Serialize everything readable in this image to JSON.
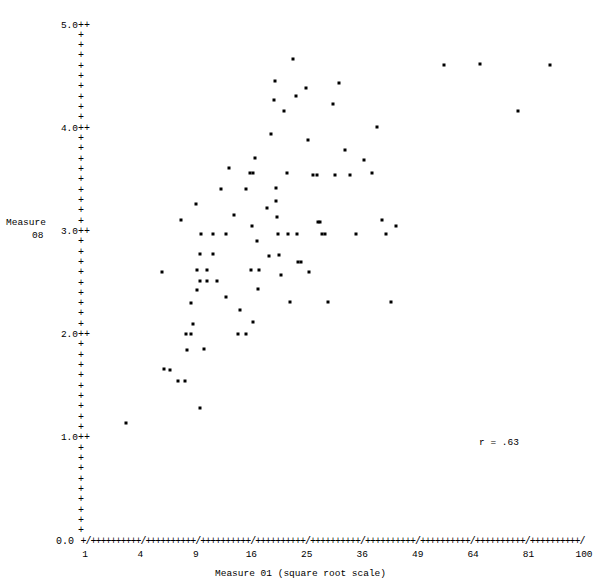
{
  "chart_data": {
    "type": "scatter",
    "title": "",
    "xlabel": "Measure 01 (square root scale)",
    "ylabel": "Measure 08",
    "ylabel_line1": "Measure",
    "ylabel_line2": "08",
    "x_scale": "sqrt",
    "x_tick_labels": [
      "1",
      "4",
      "9",
      "16",
      "25",
      "36",
      "49",
      "64",
      "81",
      "100"
    ],
    "x_tick_values": [
      1,
      4,
      9,
      16,
      25,
      36,
      49,
      64,
      81,
      100
    ],
    "y_tick_labels": [
      "5.0",
      "4.0",
      "3.0",
      "2.0",
      "1.0",
      "0.0"
    ],
    "y_tick_values": [
      5.0,
      4.0,
      3.0,
      2.0,
      1.0,
      0.0
    ],
    "ylim": [
      0.0,
      5.0
    ],
    "xlim": [
      1,
      100
    ],
    "grid": false,
    "legend": null,
    "annotation": "r = .63",
    "correlation": 0.63,
    "axis_glyph_tick": "+",
    "axis_glyph_major": "/",
    "point_glyph": "*",
    "n_points": 92,
    "points": [
      [
        3.0,
        1.15
      ],
      [
        5.9,
        1.68
      ],
      [
        6.4,
        1.67
      ],
      [
        7.2,
        1.56
      ],
      [
        7.9,
        1.56
      ],
      [
        5.7,
        2.62
      ],
      [
        8.1,
        1.86
      ],
      [
        9.4,
        1.3
      ],
      [
        8.0,
        2.02
      ],
      [
        8.5,
        2.02
      ],
      [
        8.7,
        2.11
      ],
      [
        8.5,
        2.32
      ],
      [
        9.9,
        1.87
      ],
      [
        9.1,
        2.44
      ],
      [
        9.4,
        2.53
      ],
      [
        10.3,
        2.53
      ],
      [
        11.4,
        2.53
      ],
      [
        9.1,
        2.64
      ],
      [
        10.2,
        2.64
      ],
      [
        9.5,
        2.79
      ],
      [
        10.9,
        2.79
      ],
      [
        9.6,
        2.98
      ],
      [
        11.0,
        2.98
      ],
      [
        12.6,
        2.98
      ],
      [
        9.0,
        3.28
      ],
      [
        13.6,
        3.17
      ],
      [
        11.9,
        3.42
      ],
      [
        12.6,
        2.37
      ],
      [
        14.4,
        2.25
      ],
      [
        7.5,
        3.12
      ],
      [
        12.9,
        3.62
      ],
      [
        14.2,
        2.02
      ],
      [
        15.3,
        2.02
      ],
      [
        15.8,
        3.58
      ],
      [
        16.3,
        3.58
      ],
      [
        15.2,
        3.42
      ],
      [
        16.6,
        3.72
      ],
      [
        16.1,
        3.06
      ],
      [
        16.9,
        2.92
      ],
      [
        15.9,
        2.64
      ],
      [
        17.1,
        2.64
      ],
      [
        17.0,
        2.45
      ],
      [
        16.3,
        2.13
      ],
      [
        18.3,
        3.24
      ],
      [
        18.6,
        2.77
      ],
      [
        18.9,
        3.95
      ],
      [
        19.4,
        4.28
      ],
      [
        19.6,
        4.47
      ],
      [
        19.8,
        3.43
      ],
      [
        19.8,
        3.3
      ],
      [
        19.9,
        3.15
      ],
      [
        20.0,
        2.98
      ],
      [
        20.2,
        2.78
      ],
      [
        20.6,
        2.59
      ],
      [
        21.1,
        4.18
      ],
      [
        21.6,
        3.58
      ],
      [
        21.8,
        2.98
      ],
      [
        22.0,
        2.33
      ],
      [
        22.6,
        4.68
      ],
      [
        23.1,
        4.32
      ],
      [
        23.3,
        2.98
      ],
      [
        23.4,
        2.71
      ],
      [
        23.9,
        2.71
      ],
      [
        24.8,
        4.4
      ],
      [
        25.3,
        3.9
      ],
      [
        25.4,
        2.62
      ],
      [
        26.1,
        3.56
      ],
      [
        26.8,
        3.56
      ],
      [
        27.1,
        3.1
      ],
      [
        27.5,
        3.1
      ],
      [
        27.9,
        2.98
      ],
      [
        28.4,
        2.98
      ],
      [
        28.9,
        2.33
      ],
      [
        30.0,
        4.24
      ],
      [
        30.4,
        3.56
      ],
      [
        31.2,
        4.45
      ],
      [
        32.3,
        3.8
      ],
      [
        33.4,
        3.56
      ],
      [
        34.6,
        2.98
      ],
      [
        36.3,
        3.7
      ],
      [
        38.1,
        3.58
      ],
      [
        39.2,
        4.02
      ],
      [
        40.4,
        3.12
      ],
      [
        41.3,
        2.98
      ],
      [
        42.6,
        2.33
      ],
      [
        43.8,
        3.06
      ],
      [
        56.0,
        4.62
      ],
      [
        66.0,
        4.63
      ],
      [
        77.5,
        4.18
      ],
      [
        88.0,
        4.62
      ]
    ]
  },
  "axis": {
    "y_axis_tick_glyph": "+",
    "y_major_glyph": "++",
    "zero_label": "0.0",
    "one_label": "1.0",
    "two_label": "2.0",
    "three_label": "3.0",
    "four_label": "4.0",
    "five_label": "5.0"
  }
}
